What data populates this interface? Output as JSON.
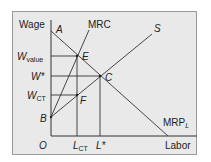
{
  "diagram": {
    "type": "monopsony labor market",
    "axes": {
      "y_label": "Wage",
      "x_label": "Labor",
      "origin_label": "O"
    },
    "curves": [
      {
        "id": "mrc",
        "label": "MRC"
      },
      {
        "id": "supply",
        "label": "S"
      },
      {
        "id": "mrp",
        "label": "MRP",
        "label_sub": "L"
      }
    ],
    "points": [
      {
        "id": "A",
        "label": "A"
      },
      {
        "id": "B",
        "label": "B"
      },
      {
        "id": "C",
        "label": "C"
      },
      {
        "id": "E",
        "label": "E"
      },
      {
        "id": "F",
        "label": "F"
      }
    ],
    "y_ticks": [
      {
        "id": "w_value",
        "main": "W",
        "sub": "value"
      },
      {
        "id": "w_star",
        "main": "W*",
        "sub": ""
      },
      {
        "id": "w_ct",
        "main": "W",
        "sub": "CT"
      }
    ],
    "x_ticks": [
      {
        "id": "l_ct",
        "main": "L",
        "sub": "CT"
      },
      {
        "id": "l_star",
        "main": "L*",
        "sub": ""
      }
    ],
    "colors": {
      "background": "#e9e9e9",
      "lines": "#333333",
      "border": "#9a9a9a"
    }
  }
}
